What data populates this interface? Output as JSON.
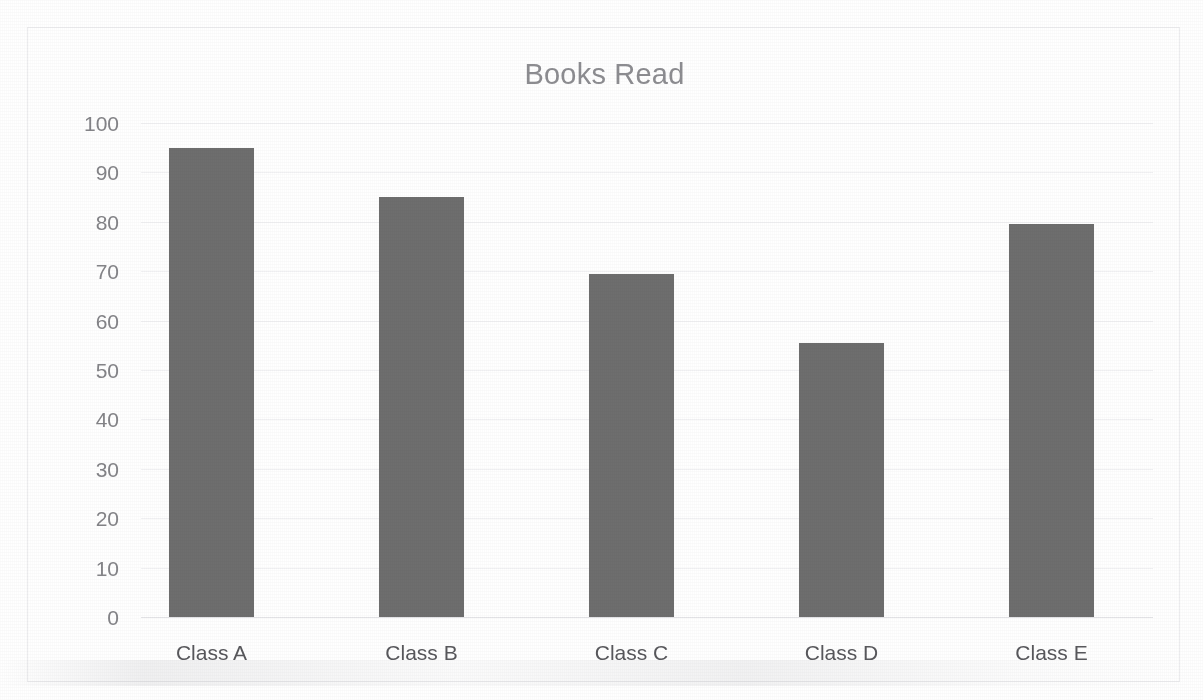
{
  "document": {
    "background_color": "#ffffff",
    "top_cut_text": "",
    "border_color": "#ededef"
  },
  "chart_data": {
    "type": "bar",
    "title": "Books Read",
    "xlabel": "",
    "ylabel": "",
    "categories": [
      "Class A",
      "Class B",
      "Class C",
      "Class D",
      "Class E"
    ],
    "values": [
      95,
      85,
      69.5,
      55.5,
      79.5
    ],
    "series": [
      {
        "name": "Books Read",
        "values": [
          95,
          85,
          69.5,
          55.5,
          79.5
        ]
      }
    ],
    "ylim": [
      0,
      100
    ],
    "ytick_step": 10,
    "ytick_labels": [
      "100",
      "90",
      "80",
      "70",
      "60",
      "50",
      "40",
      "30",
      "20",
      "10",
      "0"
    ],
    "ytick_values": [
      100,
      90,
      80,
      70,
      60,
      50,
      40,
      30,
      20,
      10,
      0
    ],
    "grid": true,
    "grid_axis": "y",
    "legend": false,
    "legend_position": "none",
    "bar_color": "#6e6e6e",
    "gridline_color": "#f1f1f3",
    "title_color": "#8d8d91",
    "tick_label_color": "#848488",
    "category_label_color": "#58585c"
  }
}
